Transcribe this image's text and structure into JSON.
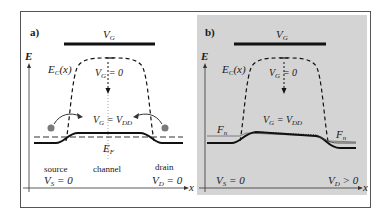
{
  "figure": {
    "frame_color": "#555555",
    "panel_b_bg": "#d4d4d4",
    "ink_color": "#1a1a1a",
    "dot_color": "#7a7a7a"
  },
  "panel_a": {
    "label": "a)",
    "gate_label": "V",
    "gate_sub": "G",
    "axis_y_label": "E",
    "axis_x_label": "x",
    "band_label": "E",
    "band_sub": "C",
    "band_arg": "(x)",
    "vg0_label": "V",
    "vg0_sub": "G",
    "vg0_eq": " = 0",
    "vgdd_label": "V",
    "vgdd_sub": "G",
    "vgdd_eq": " = V",
    "vgdd_sub2": "DD",
    "fermi_label": "E",
    "fermi_sub": "F",
    "source_label": "source",
    "source_v": "V",
    "source_sub": "S",
    "source_eq": " = 0",
    "channel_label": "channel",
    "drain_label": "drain",
    "drain_v": "V",
    "drain_sub": "D",
    "drain_eq": " = 0"
  },
  "panel_b": {
    "label": "b)",
    "gate_label": "V",
    "gate_sub": "G",
    "axis_y_label": "E",
    "axis_x_label": "x",
    "band_label": "E",
    "band_sub": "C",
    "band_arg": "(x)",
    "vg0_label": "V",
    "vg0_sub": "G",
    "vg0_eq": " = 0",
    "vgdd_label": "V",
    "vgdd_sub": "G",
    "vgdd_eq": " = V",
    "vgdd_sub2": "DD",
    "fn_left_label": "F",
    "fn_left_sub": "n",
    "fn_right_label": "F",
    "fn_right_sub": "n",
    "source_v": "V",
    "source_sub": "S",
    "source_eq": " = 0",
    "drain_v": "V",
    "drain_sub": "D",
    "drain_eq": " > 0"
  }
}
